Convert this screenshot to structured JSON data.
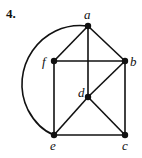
{
  "problem_number": "4.",
  "graph": {
    "nodes": [
      {
        "id": "a",
        "label": "a",
        "x": 88,
        "y": 26
      },
      {
        "id": "b",
        "label": "b",
        "x": 125,
        "y": 61
      },
      {
        "id": "f",
        "label": "f",
        "x": 54,
        "y": 61
      },
      {
        "id": "d",
        "label": "d",
        "x": 88,
        "y": 97
      },
      {
        "id": "e",
        "label": "e",
        "x": 54,
        "y": 135
      },
      {
        "id": "c",
        "label": "c",
        "x": 125,
        "y": 135
      }
    ],
    "edges": [
      [
        "a",
        "f"
      ],
      [
        "a",
        "b"
      ],
      [
        "a",
        "d"
      ],
      [
        "f",
        "b"
      ],
      [
        "f",
        "e"
      ],
      [
        "b",
        "c"
      ],
      [
        "b",
        "d"
      ],
      [
        "d",
        "e"
      ],
      [
        "d",
        "c"
      ],
      [
        "e",
        "c"
      ],
      [
        "a",
        "e"
      ]
    ],
    "curved_edges": [
      [
        "a",
        "e"
      ]
    ]
  }
}
